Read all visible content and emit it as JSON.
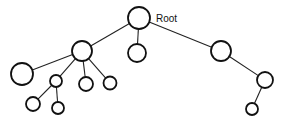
{
  "diagram": {
    "type": "tree",
    "root_label": "Root",
    "nodes": [
      {
        "id": "root",
        "label": "Root",
        "cx": 139,
        "cy": 18,
        "r": 11
      },
      {
        "id": "n1",
        "label": "",
        "cx": 82,
        "cy": 51,
        "r": 10
      },
      {
        "id": "n2",
        "label": "",
        "cx": 137,
        "cy": 53,
        "r": 9
      },
      {
        "id": "n3",
        "label": "",
        "cx": 221,
        "cy": 51,
        "r": 10
      },
      {
        "id": "n4",
        "label": "",
        "cx": 22,
        "cy": 74,
        "r": 11
      },
      {
        "id": "n5",
        "label": "",
        "cx": 56,
        "cy": 81,
        "r": 6
      },
      {
        "id": "n6",
        "label": "",
        "cx": 86,
        "cy": 84,
        "r": 7
      },
      {
        "id": "n7",
        "label": "",
        "cx": 110,
        "cy": 83,
        "r": 6.5
      },
      {
        "id": "n8",
        "label": "",
        "cx": 33,
        "cy": 104,
        "r": 7
      },
      {
        "id": "n9",
        "label": "",
        "cx": 58,
        "cy": 108,
        "r": 6
      },
      {
        "id": "n10",
        "label": "",
        "cx": 265,
        "cy": 80,
        "r": 8
      },
      {
        "id": "n11",
        "label": "",
        "cx": 252,
        "cy": 109,
        "r": 6
      }
    ],
    "edges": [
      [
        "root",
        "n1"
      ],
      [
        "root",
        "n2"
      ],
      [
        "root",
        "n3"
      ],
      [
        "n1",
        "n4"
      ],
      [
        "n1",
        "n5"
      ],
      [
        "n1",
        "n6"
      ],
      [
        "n1",
        "n7"
      ],
      [
        "n5",
        "n8"
      ],
      [
        "n5",
        "n9"
      ],
      [
        "n3",
        "n10"
      ],
      [
        "n10",
        "n11"
      ]
    ]
  }
}
